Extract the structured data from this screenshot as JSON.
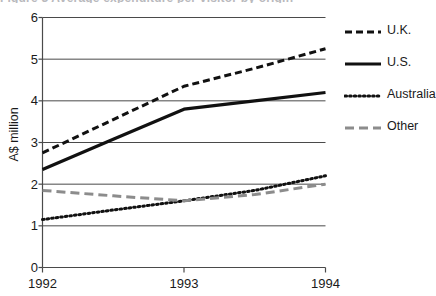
{
  "title_remnant": "Figure 3   Average expenditure per visitor by origin",
  "chart_data": {
    "type": "line",
    "title": "",
    "subtitle": "",
    "xlabel": "",
    "ylabel": "A$ million",
    "x": [
      1992,
      1993,
      1994
    ],
    "categories": [
      "1992",
      "1993",
      "1994"
    ],
    "xtick_labels": [
      "1992",
      "1993",
      "1994"
    ],
    "ytick_labels": [
      "0",
      "1",
      "2",
      "3",
      "4",
      "5",
      "6"
    ],
    "ylim": [
      0,
      6
    ],
    "xlim": [
      1992,
      1994
    ],
    "grid": "horizontal",
    "legend_position": "right",
    "series": [
      {
        "name": "U.K.",
        "style": "dashed",
        "color": "#111111",
        "values": [
          2.75,
          4.35,
          5.25
        ],
        "points": [
          {
            "x": 1992.0,
            "y": 2.75
          },
          {
            "x": 1992.5,
            "y": 3.55
          },
          {
            "x": 1993.0,
            "y": 4.35
          },
          {
            "x": 1993.5,
            "y": 4.78
          },
          {
            "x": 1994.0,
            "y": 5.25
          }
        ]
      },
      {
        "name": "U.S.",
        "style": "solid",
        "color": "#111111",
        "values": [
          2.35,
          3.8,
          4.2
        ],
        "points": [
          {
            "x": 1992.0,
            "y": 2.35
          },
          {
            "x": 1992.5,
            "y": 3.08
          },
          {
            "x": 1993.0,
            "y": 3.8
          },
          {
            "x": 1993.5,
            "y": 4.0
          },
          {
            "x": 1994.0,
            "y": 4.2
          }
        ]
      },
      {
        "name": "Australia",
        "style": "dotted",
        "color": "#111111",
        "values": [
          1.15,
          1.6,
          2.2
        ],
        "points": [
          {
            "x": 1992.0,
            "y": 1.15
          },
          {
            "x": 1992.5,
            "y": 1.38
          },
          {
            "x": 1993.0,
            "y": 1.6
          },
          {
            "x": 1993.5,
            "y": 1.85
          },
          {
            "x": 1994.0,
            "y": 2.2
          }
        ]
      },
      {
        "name": "Other",
        "style": "long-dashed",
        "color": "#8c8c8c",
        "values": [
          1.85,
          1.6,
          2.0
        ],
        "points": [
          {
            "x": 1992.0,
            "y": 1.85
          },
          {
            "x": 1992.5,
            "y": 1.72
          },
          {
            "x": 1993.0,
            "y": 1.6
          },
          {
            "x": 1993.5,
            "y": 1.75
          },
          {
            "x": 1994.0,
            "y": 2.0
          }
        ]
      }
    ]
  },
  "legend": {
    "items": [
      {
        "label": "U.K."
      },
      {
        "label": "U.S."
      },
      {
        "label": "Australia"
      },
      {
        "label": "Other"
      }
    ]
  },
  "colors": {
    "axis": "#4a4a4a",
    "grid": "#4a4a4a",
    "primary_line": "#111111",
    "other_line": "#8c8c8c",
    "text": "#1a1a1a",
    "background": "#ffffff"
  }
}
